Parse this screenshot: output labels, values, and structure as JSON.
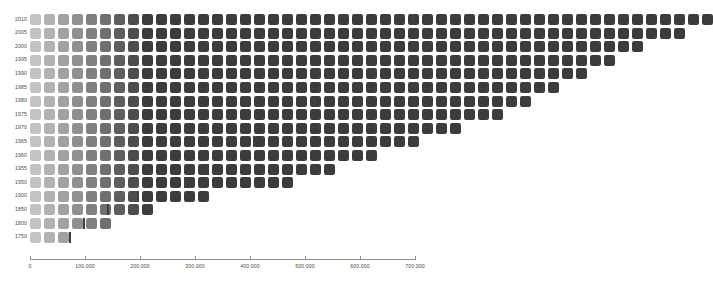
{
  "chart_data": {
    "type": "bar",
    "title": "",
    "subtitle": "",
    "xlabel": "",
    "ylabel": "",
    "xlim": [
      0,
      700000
    ],
    "grid": false,
    "legend_position": "none",
    "unit_per_square": 14000,
    "categories": [
      "2010",
      "2005",
      "2000",
      "1995",
      "1990",
      "1985",
      "1980",
      "1975",
      "1970",
      "1965",
      "1960",
      "1955",
      "1950",
      "1900",
      "1850",
      "1800",
      "1750"
    ],
    "values": [
      695000,
      670000,
      625000,
      600000,
      572000,
      545000,
      517000,
      490000,
      448000,
      406000,
      364000,
      322000,
      280000,
      195000,
      140000,
      97000,
      71000
    ],
    "xticks": [
      0,
      100000,
      200000,
      300000,
      400000,
      500000,
      600000,
      700000
    ],
    "xticklabels": [
      "0",
      "100,000",
      "200,000",
      "300,000",
      "400,000",
      "500,000",
      "600,000",
      "700,000"
    ],
    "squares_per_row": [
      49,
      47,
      44,
      42,
      40,
      38,
      36,
      34,
      31,
      28,
      25,
      22,
      19,
      13,
      9,
      6,
      3
    ],
    "color_light": "#c3c3c3",
    "color_dark": "#3c3c3c",
    "end_marker_color": "#3f3f3f",
    "axis_color": "#8f8f8f",
    "label_color": "#4b4b4b",
    "background": "#ffffff"
  },
  "axis": {
    "x_labels": [
      "0",
      "100,000",
      "200,000",
      "300,000",
      "400,000",
      "500,000",
      "600,000",
      "700,000"
    ],
    "y_labels": [
      "2010",
      "2005",
      "2000",
      "1995",
      "1990",
      "1985",
      "1980",
      "1975",
      "1970",
      "1965",
      "1960",
      "1955",
      "1950",
      "1900",
      "1850",
      "1800",
      "1750"
    ]
  }
}
